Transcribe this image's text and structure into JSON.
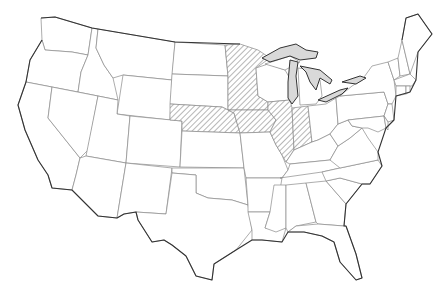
{
  "map": {
    "title": "United States",
    "colors": {
      "background": "#ffffff",
      "border": "#8a8a8a",
      "coast": "#333333",
      "lake": "#d9d9d9",
      "hatch": "#6f6f6f"
    },
    "highlighted_states": [
      "Minnesota",
      "Iowa",
      "Nebraska",
      "Illinois",
      "Indiana"
    ],
    "highlight_style": "diagonal-hatch",
    "lakes": [
      "Lake Superior",
      "Lake Michigan",
      "Lake Huron",
      "Lake Erie",
      "Lake Ontario"
    ]
  }
}
